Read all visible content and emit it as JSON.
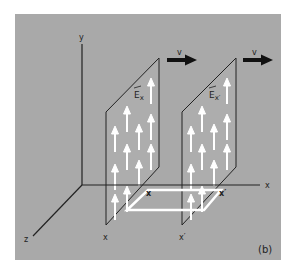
{
  "figure": {
    "panel_label": "(b)",
    "background_color": "#a9a9a9",
    "line_color": "#222222",
    "field_arrow_color": "#ffffff"
  },
  "axes": {
    "y_label": "y",
    "x_label": "x",
    "z_label": "z"
  },
  "plates": [
    {
      "name": "plate-x",
      "field_label": "E",
      "field_subscript": "x",
      "position_label": "x",
      "velocity_label": "v"
    },
    {
      "name": "plate-x-prime",
      "field_label": "E",
      "field_subscript": "x′",
      "position_label": "x′",
      "velocity_label": "v"
    }
  ],
  "rectangle": {
    "corner_label_left": "x",
    "corner_label_right": "x′"
  }
}
